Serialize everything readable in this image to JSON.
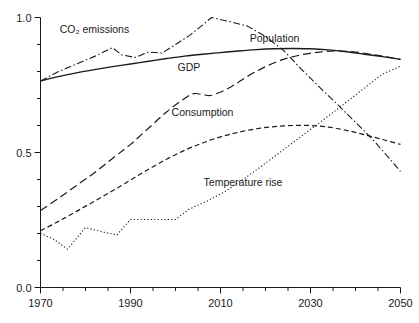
{
  "chart_data": {
    "type": "line",
    "title": "",
    "subtitle": "",
    "xlabel": "",
    "ylabel": "",
    "xlim": [
      1970,
      2050
    ],
    "ylim": [
      0.0,
      1.0
    ],
    "grid": false,
    "legend_position": "inline-labels",
    "x_ticks_major": [
      "1970",
      "1990",
      "2010",
      "2030",
      "2050"
    ],
    "x_ticks_major_values": [
      1970,
      1990,
      2010,
      2030,
      2050
    ],
    "x_ticks_minor_values": [
      1975,
      1980,
      1985,
      1995,
      2000,
      2005,
      2015,
      2020,
      2025,
      2035,
      2040,
      2045
    ],
    "y_ticks_major": [
      "0.0",
      "0.5",
      "1.0"
    ],
    "y_ticks_major_values": [
      0.0,
      0.5,
      1.0
    ],
    "y_ticks_minor_values": [
      0.1,
      0.2,
      0.3,
      0.4,
      0.6,
      0.7,
      0.8,
      0.9
    ],
    "series": [
      {
        "name": "Population",
        "label": "Population",
        "style": "solid",
        "dash": "none",
        "width": 1.4,
        "color": "#1a1a1a",
        "label_x": 2022,
        "label_y": 0.925,
        "x": [
          1970,
          1974,
          1978,
          1982,
          1986,
          1990,
          1994,
          1998,
          2002,
          2006,
          2010,
          2014,
          2018,
          2022,
          2026,
          2030,
          2034,
          2038,
          2042,
          2046,
          2050
        ],
        "values": [
          0.765,
          0.781,
          0.795,
          0.807,
          0.818,
          0.828,
          0.838,
          0.848,
          0.857,
          0.864,
          0.87,
          0.876,
          0.881,
          0.884,
          0.885,
          0.884,
          0.88,
          0.873,
          0.864,
          0.855,
          0.845
        ]
      },
      {
        "name": "CO2 emissions",
        "label": "CO₂ emissions",
        "style": "dash-dot",
        "dash": "7,2.5,1.5,2.5",
        "width": 1.1,
        "color": "#1a1a1a",
        "label_x": 1982,
        "label_y": 0.958,
        "x": [
          1970,
          1974,
          1978,
          1982,
          1986,
          1988,
          1991,
          1994,
          1997,
          2000,
          2003,
          2006,
          2008,
          2012,
          2016,
          2020,
          2024,
          2028,
          2032,
          2036,
          2040,
          2044,
          2047,
          2050
        ],
        "values": [
          0.765,
          0.8,
          0.828,
          0.856,
          0.888,
          0.862,
          0.852,
          0.872,
          0.868,
          0.9,
          0.932,
          0.972,
          1.0,
          0.985,
          0.968,
          0.93,
          0.878,
          0.808,
          0.742,
          0.678,
          0.612,
          0.545,
          0.488,
          0.43
        ]
      },
      {
        "name": "GDP",
        "label": "GDP",
        "style": "long-dash",
        "dash": "8,4",
        "width": 1.2,
        "color": "#1a1a1a",
        "label_x": 2003,
        "label_y": 0.815,
        "x": [
          1970,
          1974,
          1978,
          1982,
          1986,
          1990,
          1994,
          1998,
          2002,
          2004,
          2006,
          2008,
          2012,
          2016,
          2020,
          2024,
          2028,
          2032,
          2036,
          2040,
          2044,
          2047,
          2050
        ],
        "values": [
          0.285,
          0.33,
          0.378,
          0.425,
          0.478,
          0.53,
          0.59,
          0.65,
          0.7,
          0.718,
          0.715,
          0.712,
          0.74,
          0.782,
          0.818,
          0.845,
          0.862,
          0.872,
          0.876,
          0.872,
          0.862,
          0.854,
          0.845
        ]
      },
      {
        "name": "Consumption",
        "label": "Consumption",
        "style": "short-dash",
        "dash": "5,3",
        "width": 1.2,
        "color": "#1a1a1a",
        "label_x": 2006,
        "label_y": 0.65,
        "x": [
          1970,
          1974,
          1978,
          1982,
          1986,
          1990,
          1994,
          1998,
          2002,
          2006,
          2010,
          2014,
          2018,
          2022,
          2026,
          2030,
          2034,
          2038,
          2042,
          2046,
          2050
        ],
        "values": [
          0.21,
          0.245,
          0.282,
          0.32,
          0.358,
          0.398,
          0.438,
          0.475,
          0.508,
          0.535,
          0.558,
          0.575,
          0.588,
          0.596,
          0.6,
          0.6,
          0.594,
          0.582,
          0.566,
          0.548,
          0.53
        ]
      },
      {
        "name": "Temperature rise",
        "label": "Temperature rise",
        "style": "dotted",
        "dash": "1.2,2.2",
        "width": 1.1,
        "color": "#1a1a1a",
        "label_x": 2015,
        "label_y": 0.392,
        "x": [
          1970,
          1973,
          1976,
          1980,
          1984,
          1987,
          1990,
          1994,
          1998,
          2000,
          2003,
          2007,
          2011,
          2015,
          2019,
          2023,
          2027,
          2031,
          2035,
          2039,
          2043,
          2046,
          2050
        ],
        "values": [
          0.2,
          0.178,
          0.142,
          0.222,
          0.205,
          0.195,
          0.252,
          0.252,
          0.252,
          0.252,
          0.29,
          0.32,
          0.355,
          0.4,
          0.448,
          0.498,
          0.548,
          0.598,
          0.648,
          0.7,
          0.752,
          0.79,
          0.82
        ]
      }
    ]
  }
}
